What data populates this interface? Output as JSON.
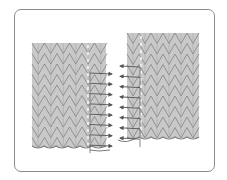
{
  "figure": {
    "type": "knitting-seam-diagram",
    "colors": {
      "frame_border": "#8a8a8a",
      "fabric_fill": "#c9c9c9",
      "stitch_line": "#7a7a7a",
      "yarn_arrow": "#555555",
      "background": "#ffffff"
    },
    "left_swatch": {
      "x": 32,
      "y": 43,
      "columns": 6,
      "rows": 10,
      "col_width": 12.5,
      "row_height": 10.5
    },
    "right_swatch": {
      "x": 127,
      "y": 33,
      "columns": 6,
      "rows": 10,
      "col_width": 12,
      "row_height": 10.5
    },
    "left_arrows_count": 8,
    "right_arrows_count": 8
  }
}
